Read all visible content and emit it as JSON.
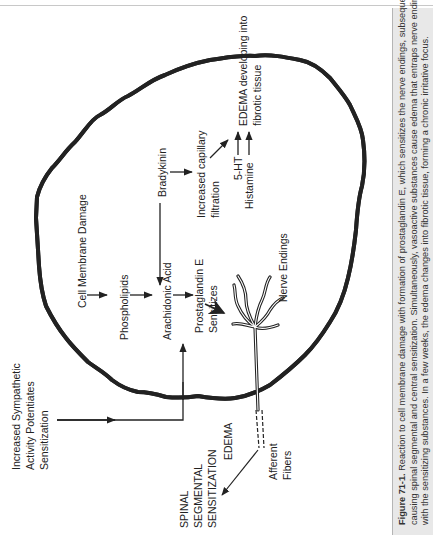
{
  "figure": {
    "orientation": "rotated-90-ccw",
    "colors": {
      "line": "#222222",
      "membrane_fill": "#bbbbbb",
      "caption_bg": "#e8e8e8",
      "caption_border": "#b5b5b5",
      "rule": "#c8c8c8"
    },
    "labels": {
      "sympathetic": [
        "Increased Sympathetic",
        "Activity Potentiates",
        "Sensitization"
      ],
      "spinal": [
        "SPINAL",
        "SEGMENTAL",
        "SENSITIZATION"
      ],
      "cell_membrane": "Cell Membrane Damage",
      "phospholipids": "Phospholipids",
      "arachidonic": "Arachidonic Acid",
      "prostaglandin": [
        "Prostaglandin E",
        "Sensitizes"
      ],
      "bradykinin": "Bradykinin",
      "capillary": [
        "Increased capillary",
        "filtration"
      ],
      "edema_fibrotic": [
        "EDEMA developing into",
        "fibrotic tissue"
      ],
      "five_ht": "5-HT",
      "histamine": "Histamine",
      "nerve_endings": "Nerve Endings",
      "edema": "EDEMA",
      "afferent": [
        "Afferent",
        "Fibers"
      ]
    },
    "caption": {
      "figure_number": "Figure 71-1.",
      "lines": [
        " Reaction to cell membrane damage with formation of prostaglandin E, which sensitizes the nerve endings, subsequently",
        "causing spinal segmental and central sensitization. Simultaneously, vasoactive substances cause edema that entraps nerve endings along",
        "with the sensitizing substances. In a few weeks, the edema changes into fibrotic tissue, forming a chronic irritative focus."
      ]
    }
  }
}
